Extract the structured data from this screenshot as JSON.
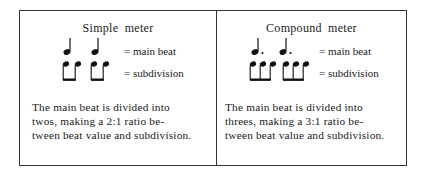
{
  "simple": {
    "title": "Simple meter",
    "main_beat_label": "= main beat",
    "subdivision_label": "= subdivision",
    "main_beat_symbol": "quarter-note",
    "subdivision_symbol": "beamed-eighth-pair",
    "description_lines": [
      "The main beat is divided into",
      "twos, making a 2:1 ratio  be-",
      "tween beat value and subdivision."
    ]
  },
  "compound": {
    "title": "Compound meter",
    "main_beat_label": "= main beat",
    "subdivision_label": "= subdivision",
    "main_beat_symbol": "dotted-quarter-note",
    "subdivision_symbol": "beamed-eighth-triplet",
    "description_lines": [
      "The main beat is divided into",
      "threes, making a 3:1 ratio be-",
      "tween beat value and subdivision."
    ]
  }
}
